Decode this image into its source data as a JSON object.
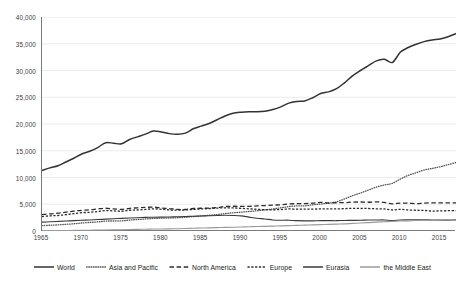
{
  "chart_data": {
    "type": "line",
    "title": "",
    "subtitle": "",
    "xlabel": "",
    "ylabel": "",
    "xlim": [
      1965,
      2017
    ],
    "ylim": [
      0,
      40000
    ],
    "grid": true,
    "legend_position": "bottom",
    "y_ticks": [
      0,
      5000,
      10000,
      15000,
      20000,
      25000,
      30000,
      35000,
      40000
    ],
    "y_tick_labels": [
      "0",
      "5,000",
      "10,000",
      "15,000",
      "20,000",
      "25,000",
      "30,000",
      "35,000",
      "40,000"
    ],
    "x_ticks": [
      1965,
      1970,
      1975,
      1980,
      1985,
      1990,
      1995,
      2000,
      2005,
      2010,
      2015
    ],
    "x_tick_labels": [
      "1965",
      "1970",
      "1975",
      "1980",
      "1985",
      "1990",
      "1995",
      "2000",
      "2005",
      "2010",
      "2015"
    ],
    "x": [
      1965,
      1966,
      1967,
      1968,
      1969,
      1970,
      1971,
      1972,
      1973,
      1974,
      1975,
      1976,
      1977,
      1978,
      1979,
      1980,
      1981,
      1982,
      1983,
      1984,
      1985,
      1986,
      1987,
      1988,
      1989,
      1990,
      1991,
      1992,
      1993,
      1994,
      1995,
      1996,
      1997,
      1998,
      1999,
      2000,
      2001,
      2002,
      2003,
      2004,
      2005,
      2006,
      2007,
      2008,
      2009,
      2010,
      2011,
      2012,
      2013,
      2014,
      2015,
      2016,
      2017
    ],
    "series": [
      {
        "name": "World",
        "style": "solid-thick",
        "color": "#333333",
        "values": [
          11300,
          11800,
          12200,
          12900,
          13600,
          14400,
          14900,
          15600,
          16500,
          16400,
          16300,
          17100,
          17600,
          18100,
          18700,
          18500,
          18200,
          18100,
          18300,
          19100,
          19600,
          20100,
          20800,
          21500,
          22000,
          22200,
          22300,
          22300,
          22400,
          22700,
          23200,
          23900,
          24200,
          24300,
          24900,
          25700,
          26000,
          26600,
          27700,
          29000,
          30000,
          30900,
          31800,
          32100,
          31500,
          33400,
          34300,
          34900,
          35400,
          35700,
          35900,
          36300,
          36900
        ]
      },
      {
        "name": "Asia and Pacific",
        "style": "dotted",
        "color": "#555555",
        "values": [
          1000,
          1080,
          1150,
          1250,
          1350,
          1500,
          1600,
          1700,
          1850,
          1870,
          1900,
          2050,
          2150,
          2250,
          2350,
          2400,
          2430,
          2480,
          2570,
          2700,
          2820,
          2940,
          3080,
          3260,
          3400,
          3520,
          3650,
          3790,
          3950,
          4120,
          4350,
          4560,
          4700,
          4700,
          4900,
          5050,
          5200,
          5450,
          6000,
          6600,
          7100,
          7650,
          8200,
          8600,
          8900,
          9700,
          10400,
          10900,
          11400,
          11700,
          12000,
          12400,
          12800
        ]
      },
      {
        "name": "North America",
        "style": "dashed-long",
        "color": "#2b2b2b",
        "values": [
          3050,
          3200,
          3330,
          3520,
          3720,
          3870,
          3950,
          4120,
          4250,
          4130,
          4040,
          4230,
          4340,
          4420,
          4460,
          4300,
          4190,
          4030,
          4020,
          4210,
          4250,
          4270,
          4400,
          4570,
          4630,
          4600,
          4600,
          4690,
          4760,
          4840,
          4900,
          5050,
          5100,
          5120,
          5200,
          5350,
          5230,
          5280,
          5300,
          5400,
          5420,
          5370,
          5460,
          5340,
          5080,
          5220,
          5200,
          5120,
          5210,
          5260,
          5250,
          5240,
          5270
        ]
      },
      {
        "name": "Europe",
        "style": "dashed-short",
        "color": "#2b2b2b",
        "values": [
          2700,
          2830,
          2900,
          3060,
          3250,
          3420,
          3500,
          3640,
          3800,
          3760,
          3690,
          3880,
          3930,
          4030,
          4150,
          4060,
          3940,
          3890,
          3930,
          4040,
          4120,
          4190,
          4280,
          4330,
          4320,
          4230,
          4150,
          4060,
          3990,
          3960,
          4020,
          4120,
          4080,
          4100,
          4090,
          4130,
          4150,
          4120,
          4190,
          4220,
          4210,
          4210,
          4150,
          4130,
          3930,
          4050,
          3930,
          3880,
          3840,
          3730,
          3760,
          3790,
          3820
        ]
      },
      {
        "name": "Eurasia",
        "style": "solid",
        "color": "#3a3a3a",
        "values": [
          1650,
          1720,
          1790,
          1860,
          1930,
          2000,
          2070,
          2140,
          2220,
          2300,
          2360,
          2420,
          2480,
          2540,
          2580,
          2600,
          2630,
          2670,
          2710,
          2760,
          2800,
          2850,
          2900,
          2930,
          2900,
          2830,
          2600,
          2380,
          2250,
          2070,
          2020,
          2020,
          1930,
          1900,
          1900,
          1930,
          1940,
          1930,
          1970,
          1990,
          2000,
          2050,
          2060,
          2070,
          1940,
          2060,
          2090,
          2110,
          2090,
          2060,
          2030,
          2040,
          2080
        ]
      },
      {
        "name": "the Middle East",
        "style": "solid-light",
        "color": "#9a9a9a",
        "values": [
          60,
          70,
          80,
          95,
          110,
          130,
          150,
          175,
          200,
          220,
          240,
          270,
          300,
          330,
          360,
          380,
          400,
          430,
          470,
          510,
          550,
          590,
          630,
          670,
          710,
          750,
          790,
          830,
          870,
          910,
          960,
          1000,
          1050,
          1100,
          1140,
          1190,
          1230,
          1280,
          1330,
          1420,
          1500,
          1570,
          1660,
          1740,
          1790,
          1860,
          1900,
          1960,
          1990,
          2010,
          2030,
          2050,
          2070
        ]
      }
    ]
  },
  "legend": {
    "items": [
      {
        "label": "World",
        "style": "solid-thick"
      },
      {
        "label": "Asia and Pacific",
        "style": "dotted"
      },
      {
        "label": "North America",
        "style": "dashed-long"
      },
      {
        "label": "Europe",
        "style": "dashed-short"
      },
      {
        "label": "Eurasia",
        "style": "solid"
      },
      {
        "label": "the Middle East",
        "style": "solid-light"
      }
    ]
  },
  "colors": {
    "grid": "#e3e3e3",
    "axis": "#7a7a7a",
    "background": "#ffffff",
    "text": "#1a1a1a"
  }
}
